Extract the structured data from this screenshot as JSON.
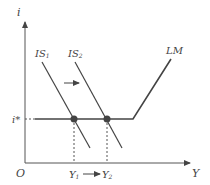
{
  "diagram": {
    "axes": {
      "y_label": "i",
      "x_label": "Y",
      "origin_label": "O"
    },
    "curves": {
      "is1": {
        "label": "IS",
        "sub": "1"
      },
      "is2": {
        "label": "IS",
        "sub": "2"
      },
      "lm": {
        "label": "LM"
      }
    },
    "rate_label": "i*",
    "output_labels": {
      "y1": {
        "label": "Y",
        "sub": "1"
      },
      "y2": {
        "label": "Y",
        "sub": "2"
      }
    },
    "colors": {
      "line": "#444444",
      "point": "#444444"
    }
  }
}
